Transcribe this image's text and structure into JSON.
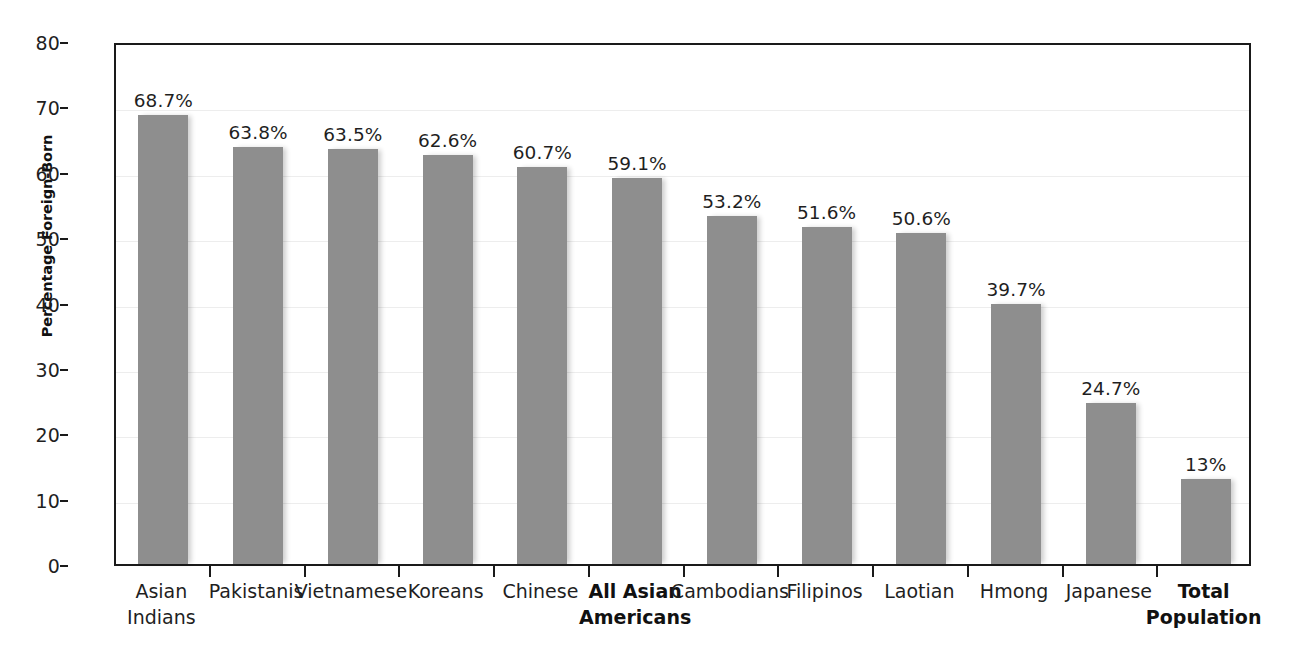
{
  "chart_data": {
    "type": "bar",
    "title": "",
    "subtitle": "",
    "xlabel": "",
    "ylabel": "Percentage Foreign-Born",
    "ylim": [
      0,
      80
    ],
    "ytick_step": 10,
    "yticks": [
      "80",
      "70",
      "60",
      "50",
      "40",
      "30",
      "20",
      "10",
      "0"
    ],
    "grid": true,
    "legend": "none",
    "bar_color": "#8e8e8e",
    "axis_color": "#1a1a1a",
    "grid_color": "#ededed",
    "categories": [
      "Asian Indians",
      "Pakistanis",
      "Vietnamese",
      "Koreans",
      "Chinese",
      "All Asian Americans",
      "Cambodians",
      "Filipinos",
      "Laotian",
      "Hmong",
      "Japanese",
      "Total Population"
    ],
    "values": [
      68.7,
      63.8,
      63.5,
      62.6,
      60.7,
      59.1,
      53.2,
      51.6,
      50.6,
      39.7,
      24.7,
      13.0
    ],
    "data_labels": [
      "68.7%",
      "63.8%",
      "63.5%",
      "62.6%",
      "60.7%",
      "59.1%",
      "53.2%",
      "51.6%",
      "50.6%",
      "39.7%",
      "24.7%",
      "13%"
    ],
    "category_lines": [
      [
        "Asian",
        "Indians"
      ],
      [
        "Pakistanis",
        ""
      ],
      [
        "Vietnamese",
        ""
      ],
      [
        "Koreans",
        ""
      ],
      [
        "Chinese",
        ""
      ],
      [
        "All Asian",
        "Americans"
      ],
      [
        "Cambodians",
        ""
      ],
      [
        "Filipinos",
        ""
      ],
      [
        "Laotian",
        ""
      ],
      [
        "Hmong",
        ""
      ],
      [
        "Japanese",
        ""
      ],
      [
        "Total",
        "Population"
      ]
    ],
    "emphasized_categories": [
      "All Asian Americans",
      "Total Population"
    ]
  }
}
